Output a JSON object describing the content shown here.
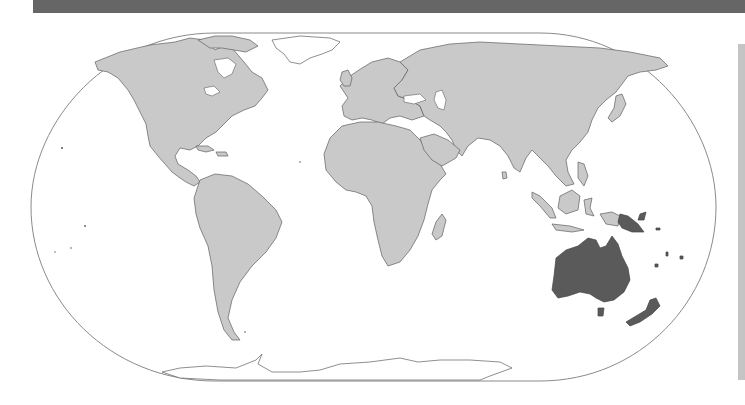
{
  "header": {
    "bar_color": "#666666"
  },
  "map": {
    "type": "locator-map",
    "projection": "pseudo-cylindrical world",
    "highlighted_region": "Oceania",
    "highlighted_countries": [
      "Australia",
      "Papua New Guinea",
      "New Zealand",
      "Solomon Islands",
      "Vanuatu",
      "Fiji",
      "New Caledonia"
    ],
    "colors": {
      "land": "#c9c9c9",
      "highlight": "#5a5a5a",
      "ocean": "#ffffff",
      "border": "#5f5f5f",
      "outline": "#8a8a8a"
    },
    "labels": []
  },
  "side_panel": {
    "color": "#c4c4c4"
  }
}
